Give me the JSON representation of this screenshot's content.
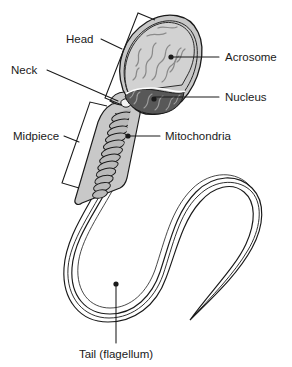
{
  "figure": {
    "type": "labeled-anatomical-diagram",
    "background_color": "#ffffff",
    "line_color": "#1a1a1a",
    "text_color": "#1a1a1a"
  },
  "labels": {
    "head": "Head",
    "neck": "Neck",
    "midpiece": "Midpiece",
    "acrosome": "Acrosome",
    "nucleus": "Nucleus",
    "mitochondria": "Mitochondria",
    "tail": "Tail (flagellum)"
  },
  "label_positions": {
    "head": {
      "x": 66,
      "y": 43,
      "anchor": "start"
    },
    "neck": {
      "x": 11,
      "y": 74,
      "anchor": "start"
    },
    "midpiece": {
      "x": 13,
      "y": 140,
      "anchor": "start"
    },
    "acrosome": {
      "x": 225,
      "y": 61,
      "anchor": "start"
    },
    "nucleus": {
      "x": 225,
      "y": 101,
      "anchor": "start"
    },
    "mitochondria": {
      "x": 165,
      "y": 140,
      "anchor": "start"
    },
    "tail": {
      "x": 116,
      "y": 358,
      "anchor": "middle"
    }
  },
  "parts": {
    "acrosome": {
      "name": "acrosome",
      "description": "Cap covering the anterior portion of the nucleus",
      "fill_color": "#d2d2d2",
      "texture_color": "#8a8a8a"
    },
    "nucleus": {
      "name": "nucleus",
      "description": "Dense condensed chromatin region in the head",
      "fill_color": "#585858",
      "texture_color": "#9a9a9a"
    },
    "head": {
      "name": "head",
      "description": "Oval anterior region containing acrosome and nucleus",
      "fill_color": "#c8c8c8"
    },
    "neck": {
      "name": "neck",
      "description": "Short connecting piece between head and midpiece",
      "fill_color": "#c8c8c8"
    },
    "midpiece": {
      "name": "midpiece",
      "description": "Region containing helically coiled mitochondria",
      "fill_color": "#c8c8c8"
    },
    "mitochondria": {
      "name": "mitochondria",
      "description": "Helical sheath of mitochondria around the axoneme",
      "fill_color": "#b4b4b4",
      "coil_count": 14
    },
    "tail": {
      "name": "tail",
      "description": "Long flagellum with an S-shaped curve tapering to a point",
      "fill_color": "#dcdcdc"
    }
  },
  "leader_lines": {
    "head": "bracket spanning the head region, tilted along the head axis",
    "neck": "straight line from the Neck label to the neck junction",
    "midpiece": "bracket spanning the midpiece region, tilted along the midpiece axis",
    "acrosome": "horizontal line with dot terminator inside the acrosome",
    "nucleus": "horizontal line with dot terminator inside the nucleus",
    "mitochondria": "horizontal line with dot terminator on the mitochondrial coil",
    "tail": "vertical line with dot terminator at the bottom of the tail loop"
  }
}
